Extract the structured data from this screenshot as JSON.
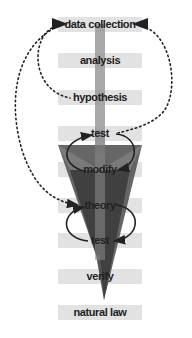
{
  "diagram": {
    "steps": [
      {
        "label": "data collection",
        "y": 17
      },
      {
        "label": "analysis",
        "y": 53
      },
      {
        "label": "hypothesis",
        "y": 90
      },
      {
        "label": "test",
        "y": 126
      },
      {
        "label": "modify",
        "y": 162
      },
      {
        "label": "theory",
        "y": 198
      },
      {
        "label": "test",
        "y": 233
      },
      {
        "label": "verify",
        "y": 269
      },
      {
        "label": "natural law",
        "y": 305
      }
    ],
    "colors": {
      "bar": "#e2e2e2",
      "stem": "#8a8a8a",
      "funnel_light": "#7a7a7a",
      "funnel_dark": "#3a3a3a",
      "text": "#222222"
    }
  }
}
